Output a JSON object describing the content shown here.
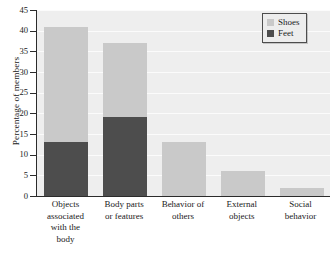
{
  "chart_data": {
    "type": "bar",
    "subtype": "stacked",
    "title": "",
    "xlabel": "",
    "ylabel": "Percentage of members",
    "ylim": [
      0,
      45
    ],
    "ytick_step": 5,
    "yticks": [
      0,
      5,
      10,
      15,
      20,
      25,
      30,
      35,
      40,
      45
    ],
    "ytick_labels": [
      "0",
      "5",
      "10",
      "15",
      "20",
      "25",
      "30",
      "35",
      "40",
      "45"
    ],
    "grid": "horizontal",
    "legend_position": "top-right",
    "categories": [
      "Objects associated with the body",
      "Body parts or features",
      "Behavior of others",
      "External objects",
      "Social behavior"
    ],
    "category_lines": [
      [
        "Objects",
        "associated",
        "with the",
        "body"
      ],
      [
        "Body parts",
        "or features"
      ],
      [
        "Behavior of",
        "others"
      ],
      [
        "External",
        "objects"
      ],
      [
        "Social",
        "behavior"
      ]
    ],
    "series": [
      {
        "name": "Feet",
        "color": "#4d4d4d",
        "values": [
          13,
          19,
          0,
          0,
          0
        ]
      },
      {
        "name": "Shoes",
        "color": "#c9c9c9",
        "values": [
          28,
          18,
          13,
          6,
          2
        ]
      }
    ],
    "totals": [
      41,
      37,
      13,
      6,
      2
    ],
    "plot_background": "#eeeeee",
    "gridline_color": "#fbfbfb",
    "axis_color": "#2b2b2b"
  },
  "legend": {
    "entries": [
      {
        "label": "Shoes",
        "color": "#c9c9c9"
      },
      {
        "label": "Feet",
        "color": "#4d4d4d"
      }
    ]
  }
}
